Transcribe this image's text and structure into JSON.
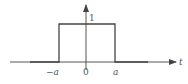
{
  "diagram": {
    "axes": {
      "x_label": "t",
      "origin_label": "0",
      "x_ticks": [
        {
          "label": "−a",
          "value": "-a"
        },
        {
          "label": "0",
          "value": "0"
        },
        {
          "label": "a",
          "value": "a"
        }
      ],
      "y_tick": {
        "label": "1",
        "value": 1
      }
    },
    "pulse": {
      "start": "-a",
      "end": "a",
      "height": 1
    },
    "colors": {
      "line": "#555555",
      "background": "#ffffff"
    }
  }
}
